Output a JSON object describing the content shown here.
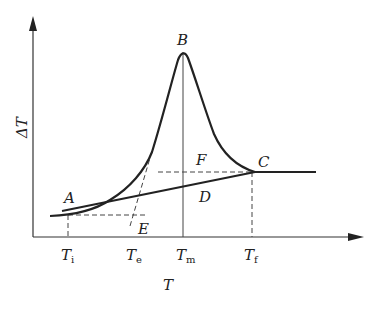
{
  "diagram": {
    "type": "DTA melting curve",
    "y_axis_label": "ΔT",
    "x_axis_label": "T",
    "points": {
      "A": "A",
      "B": "B",
      "C": "C",
      "D": "D",
      "E": "E",
      "F": "F"
    },
    "x_ticks": [
      {
        "main": "T",
        "sub": "i"
      },
      {
        "main": "T",
        "sub": "e"
      },
      {
        "main": "T",
        "sub": "m"
      },
      {
        "main": "T",
        "sub": "f"
      }
    ],
    "colors": {
      "line": "#222222",
      "background": "#ffffff"
    }
  }
}
